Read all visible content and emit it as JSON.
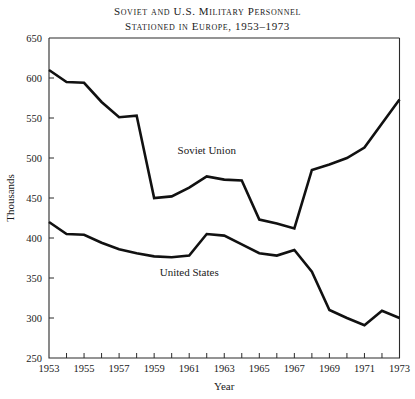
{
  "title": {
    "line1": "Soviet and U.S. Military Personnel",
    "line2": "Stationed in Europe, 1953–1973"
  },
  "chart_data": {
    "type": "line",
    "title": "Soviet and U.S. Military Personnel Stationed in Europe, 1953–1973",
    "xlabel": "Year",
    "ylabel": "Thousands",
    "xlim": [
      1953,
      1973
    ],
    "ylim": [
      250,
      650
    ],
    "xticks": [
      1953,
      1954,
      1955,
      1956,
      1957,
      1958,
      1959,
      1960,
      1961,
      1962,
      1963,
      1964,
      1965,
      1966,
      1967,
      1968,
      1969,
      1970,
      1971,
      1972,
      1973
    ],
    "xtick_labels": [
      "1953",
      "",
      "1955",
      "",
      "1957",
      "",
      "1959",
      "",
      "1961",
      "",
      "1963",
      "",
      "1965",
      "",
      "1967",
      "",
      "1969",
      "",
      "1971",
      "",
      "1973"
    ],
    "yticks": [
      250,
      300,
      350,
      400,
      450,
      500,
      550,
      600,
      650
    ],
    "ytick_labels": [
      "250",
      "300",
      "350",
      "400",
      "450",
      "500",
      "550",
      "600",
      "650"
    ],
    "grid": false,
    "legend": "inline-annotation",
    "x": [
      1953,
      1954,
      1955,
      1956,
      1957,
      1958,
      1959,
      1960,
      1961,
      1962,
      1963,
      1964,
      1965,
      1966,
      1967,
      1968,
      1969,
      1970,
      1971,
      1972,
      1973
    ],
    "series": [
      {
        "name": "Soviet Union",
        "color": "#111111",
        "label_x": 1962,
        "label_y": 505,
        "values": [
          610,
          595,
          594,
          570,
          551,
          553,
          450,
          452,
          463,
          477,
          473,
          472,
          423,
          418,
          412,
          485,
          492,
          500,
          513,
          543,
          573
        ]
      },
      {
        "name": "United States",
        "color": "#111111",
        "label_x": 1961,
        "label_y": 352,
        "values": [
          420,
          405,
          404,
          394,
          386,
          381,
          377,
          376,
          378,
          405,
          403,
          392,
          381,
          378,
          385,
          358,
          310,
          300,
          291,
          309,
          300
        ]
      }
    ]
  }
}
